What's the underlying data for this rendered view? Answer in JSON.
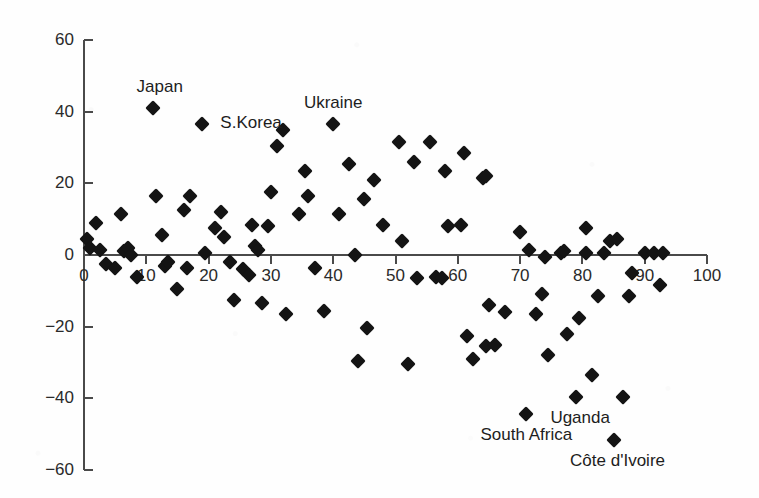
{
  "chart_data": {
    "type": "scatter",
    "title": "",
    "subtitle": "",
    "xlabel": "",
    "ylabel": "",
    "xlim": [
      0,
      100
    ],
    "ylim": [
      -60,
      60
    ],
    "grid": false,
    "legend": null,
    "x_ticks": [
      0,
      10,
      20,
      30,
      40,
      50,
      60,
      70,
      80,
      90,
      100
    ],
    "x_tick_labels": [
      "0",
      "10",
      "20",
      "30",
      "40",
      "50",
      "60",
      "70",
      "80",
      "90",
      "100"
    ],
    "y_ticks": [
      -60,
      -40,
      -20,
      0,
      20,
      40,
      60
    ],
    "y_tick_labels": [
      "-60",
      "-40",
      "-20",
      "0",
      "20",
      "40",
      "60"
    ],
    "marker": "filled-diamond",
    "marker_color": "#141414",
    "axis_color": "#4a4a4a",
    "background_color": "#fefefe",
    "points": [
      {
        "x": 0.5,
        "y": 4.5
      },
      {
        "x": 1.0,
        "y": 2.0
      },
      {
        "x": 2.0,
        "y": 9.0
      },
      {
        "x": 2.5,
        "y": 1.5
      },
      {
        "x": 3.5,
        "y": -2.5
      },
      {
        "x": 5.0,
        "y": -3.5
      },
      {
        "x": 6.0,
        "y": 11.5
      },
      {
        "x": 6.5,
        "y": 1.0
      },
      {
        "x": 7.0,
        "y": 2.0
      },
      {
        "x": 7.5,
        "y": 0.0
      },
      {
        "x": 8.5,
        "y": -6.0
      },
      {
        "x": 11.0,
        "y": 41.0,
        "label": "Japan",
        "label_pos": "above-left"
      },
      {
        "x": 11.5,
        "y": 16.5
      },
      {
        "x": 12.5,
        "y": 5.5
      },
      {
        "x": 13.0,
        "y": -3.0
      },
      {
        "x": 13.5,
        "y": -2.0
      },
      {
        "x": 15.0,
        "y": -9.5
      },
      {
        "x": 16.0,
        "y": 12.5
      },
      {
        "x": 16.5,
        "y": -3.5
      },
      {
        "x": 17.0,
        "y": 16.5
      },
      {
        "x": 19.0,
        "y": 36.5,
        "label": "S.Korea",
        "label_pos": "right"
      },
      {
        "x": 19.5,
        "y": 0.5
      },
      {
        "x": 21.0,
        "y": 7.5
      },
      {
        "x": 22.0,
        "y": 12.0
      },
      {
        "x": 22.5,
        "y": 5.0
      },
      {
        "x": 23.5,
        "y": -2.0
      },
      {
        "x": 24.0,
        "y": -12.5
      },
      {
        "x": 25.5,
        "y": -4.0
      },
      {
        "x": 26.5,
        "y": -5.5
      },
      {
        "x": 27.0,
        "y": 8.5
      },
      {
        "x": 27.5,
        "y": 2.5
      },
      {
        "x": 28.0,
        "y": 1.5
      },
      {
        "x": 28.5,
        "y": -13.5
      },
      {
        "x": 29.5,
        "y": 8.0
      },
      {
        "x": 30.0,
        "y": 17.5
      },
      {
        "x": 31.0,
        "y": 30.5
      },
      {
        "x": 32.0,
        "y": 35.0
      },
      {
        "x": 32.5,
        "y": -16.5
      },
      {
        "x": 34.5,
        "y": 11.5
      },
      {
        "x": 35.5,
        "y": 23.5
      },
      {
        "x": 36.0,
        "y": 16.5
      },
      {
        "x": 37.0,
        "y": -3.5
      },
      {
        "x": 38.5,
        "y": -15.5
      },
      {
        "x": 40.0,
        "y": 36.5,
        "label": "Ukraine",
        "label_pos": "above"
      },
      {
        "x": 41.0,
        "y": 11.5
      },
      {
        "x": 42.5,
        "y": 25.5
      },
      {
        "x": 43.5,
        "y": 0.0
      },
      {
        "x": 44.0,
        "y": -29.5
      },
      {
        "x": 45.0,
        "y": 15.5
      },
      {
        "x": 45.5,
        "y": -20.5
      },
      {
        "x": 46.5,
        "y": 21.0
      },
      {
        "x": 48.0,
        "y": 8.5
      },
      {
        "x": 50.5,
        "y": 31.5
      },
      {
        "x": 51.0,
        "y": 4.0
      },
      {
        "x": 52.0,
        "y": -30.5
      },
      {
        "x": 53.0,
        "y": 26.0
      },
      {
        "x": 53.5,
        "y": -6.5
      },
      {
        "x": 55.5,
        "y": 31.5
      },
      {
        "x": 56.5,
        "y": -6.0
      },
      {
        "x": 57.5,
        "y": -6.5
      },
      {
        "x": 58.0,
        "y": 23.5
      },
      {
        "x": 58.5,
        "y": 8.0
      },
      {
        "x": 60.5,
        "y": 8.5
      },
      {
        "x": 61.0,
        "y": 28.5
      },
      {
        "x": 61.5,
        "y": -22.5
      },
      {
        "x": 62.5,
        "y": -29.0
      },
      {
        "x": 64.0,
        "y": 21.5
      },
      {
        "x": 64.5,
        "y": 22.0
      },
      {
        "x": 64.5,
        "y": -25.5
      },
      {
        "x": 65.0,
        "y": -14.0
      },
      {
        "x": 66.0,
        "y": -25.0
      },
      {
        "x": 67.5,
        "y": -16.0
      },
      {
        "x": 70.0,
        "y": 6.5
      },
      {
        "x": 71.0,
        "y": -44.5,
        "label": "South Africa",
        "label_pos": "below"
      },
      {
        "x": 71.5,
        "y": 1.5
      },
      {
        "x": 72.5,
        "y": -16.5
      },
      {
        "x": 73.5,
        "y": -11.0
      },
      {
        "x": 74.0,
        "y": -0.5
      },
      {
        "x": 74.5,
        "y": -28.0
      },
      {
        "x": 76.5,
        "y": 0.5
      },
      {
        "x": 77.0,
        "y": 1.0
      },
      {
        "x": 77.5,
        "y": -22.0
      },
      {
        "x": 79.0,
        "y": -39.5,
        "label": "Uganda",
        "label_pos": "below-right"
      },
      {
        "x": 79.5,
        "y": -17.5
      },
      {
        "x": 80.5,
        "y": 0.5
      },
      {
        "x": 80.5,
        "y": 7.5
      },
      {
        "x": 81.5,
        "y": -33.5
      },
      {
        "x": 82.5,
        "y": -11.5
      },
      {
        "x": 83.5,
        "y": 0.5
      },
      {
        "x": 84.5,
        "y": 4.0
      },
      {
        "x": 85.0,
        "y": -51.5,
        "label": "Côte d'Ivoire",
        "label_pos": "below-right"
      },
      {
        "x": 85.5,
        "y": 4.5
      },
      {
        "x": 86.5,
        "y": -39.5
      },
      {
        "x": 87.5,
        "y": -11.5
      },
      {
        "x": 88.0,
        "y": -5.0
      },
      {
        "x": 90.0,
        "y": 0.5
      },
      {
        "x": 91.5,
        "y": 0.5
      },
      {
        "x": 92.5,
        "y": -8.5
      },
      {
        "x": 93.0,
        "y": 0.5
      }
    ],
    "annotations": [
      {
        "text": "Japan",
        "x": 11,
        "y": 41
      },
      {
        "text": "S.Korea",
        "x": 19,
        "y": 36.5
      },
      {
        "text": "Ukraine",
        "x": 40,
        "y": 36.5
      },
      {
        "text": "South Africa",
        "x": 71,
        "y": -44.5
      },
      {
        "text": "Uganda",
        "x": 79,
        "y": -39.5
      },
      {
        "text": "Côte d'Ivoire",
        "x": 85,
        "y": -51.5
      }
    ]
  },
  "labels": {
    "japan": "Japan",
    "skorea": "S.Korea",
    "ukraine": "Ukraine",
    "south_africa": "South Africa",
    "uganda": "Uganda",
    "cote_divoire": "Côte d'Ivoire"
  }
}
